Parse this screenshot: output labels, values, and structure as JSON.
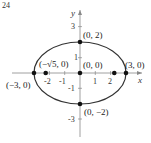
{
  "figure": {
    "number_label": "24",
    "curve": {
      "type": "ellipse",
      "center": [
        0,
        0
      ],
      "a": 3,
      "b": 2
    },
    "axes": {
      "x_label": "x",
      "y_label": "y",
      "x_ticks": [
        "-2",
        "-1",
        "1",
        "2"
      ],
      "y_ticks": [
        "3",
        "1",
        "-1",
        "-3"
      ]
    },
    "points": [
      {
        "label": "(0, 2)",
        "x": 0,
        "y": 2
      },
      {
        "label": "(0, −2)",
        "x": 0,
        "y": -2
      },
      {
        "label": "(3, 0)",
        "x": 3,
        "y": 0
      },
      {
        "label": "(−3, 0)",
        "x": -3,
        "y": 0
      },
      {
        "label": "(0, 0)",
        "x": 0,
        "y": 0
      },
      {
        "label": "(−√5, 0)",
        "x": -2.236,
        "y": 0
      },
      {
        "label": "",
        "x": 2.236,
        "y": 0
      }
    ],
    "colors": {
      "curve": "#333333",
      "axis": "#888888",
      "point": "#111111"
    }
  }
}
